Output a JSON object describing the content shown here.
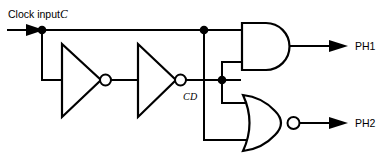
{
  "diagram": {
    "background_color": "#ffffff",
    "line_color": "#000000"
  },
  "labels": {
    "clock_input_text": "Clock input",
    "clock_input_signal": "C",
    "delayed_signal": "CD",
    "output_1": "PH1",
    "output_2": "PH2"
  },
  "components": {
    "inverter_1": "inverter-gate",
    "inverter_2": "inverter-gate",
    "and_gate": "and-gate",
    "nor_gate": "nor-gate"
  },
  "nets": {
    "input_net": "C",
    "delayed_net": "CD",
    "and_output_net": "PH1",
    "nor_output_net": "PH2"
  }
}
